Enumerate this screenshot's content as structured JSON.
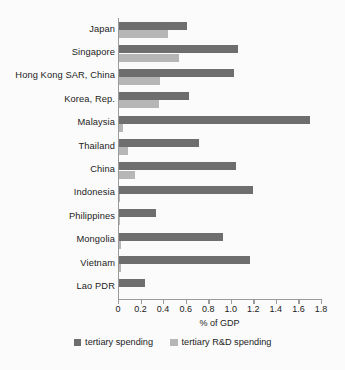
{
  "chart_data": {
    "type": "bar",
    "orientation": "horizontal",
    "title": "",
    "xlabel": "% of GDP",
    "ylabel": "",
    "xlim": [
      0,
      1.8
    ],
    "xticks": [
      0,
      0.2,
      0.4,
      0.6,
      0.8,
      1.0,
      1.2,
      1.4,
      1.6,
      1.8
    ],
    "xtick_labels": [
      "0",
      "0.2",
      "0.4",
      "0.6",
      "0.8",
      "1.0",
      "1.2",
      "1.4",
      "1.6",
      "1.8"
    ],
    "grid": false,
    "legend_position": "bottom",
    "categories": [
      "Japan",
      "Singapore",
      "Hong Kong SAR, China",
      "Korea, Rep.",
      "Malaysia",
      "Thailand",
      "China",
      "Indonesia",
      "Philippines",
      "Mongolia",
      "Vietnam",
      "Lao PDR"
    ],
    "series": [
      {
        "name": "tertiary spending",
        "color": "#6e6e6e",
        "values": [
          0.61,
          1.06,
          1.03,
          0.63,
          1.7,
          0.72,
          1.05,
          1.2,
          0.34,
          0.93,
          1.17,
          0.24
        ]
      },
      {
        "name": "tertiary R&D spending",
        "color": "#b6b6b6",
        "values": [
          0.44,
          0.54,
          0.37,
          0.36,
          0.04,
          0.09,
          0.15,
          0.02,
          0.02,
          0.03,
          0.03,
          0.01
        ]
      }
    ]
  },
  "axis": {
    "x_title": "% of GDP"
  },
  "colors": {
    "tertiary_spending": "#6e6e6e",
    "tertiary_rd_spending": "#b6b6b6",
    "axis": "#9a9a9a",
    "background": "#fbfbfb",
    "text": "#1b1b1b"
  }
}
